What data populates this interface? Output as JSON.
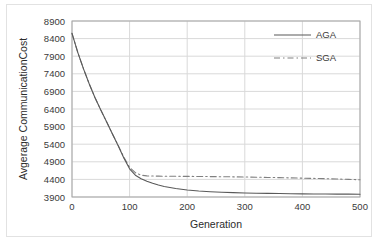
{
  "chart_data": {
    "type": "line",
    "title": "",
    "xlabel": "Generation",
    "ylabel": "Avgerage CommunicationCost",
    "xlim": [
      0,
      500
    ],
    "ylim": [
      3900,
      8900
    ],
    "xticks": [
      0,
      100,
      200,
      300,
      400,
      500
    ],
    "yticks": [
      3900,
      4400,
      4900,
      5400,
      5900,
      6400,
      6900,
      7400,
      7900,
      8400,
      8900
    ],
    "grid": "horizontal-and-vertical",
    "legend_position": "top-right",
    "x": [
      0,
      10,
      20,
      30,
      40,
      50,
      60,
      70,
      80,
      90,
      100,
      110,
      120,
      130,
      140,
      150,
      160,
      170,
      180,
      190,
      200,
      220,
      240,
      260,
      280,
      300,
      320,
      340,
      360,
      380,
      400,
      420,
      440,
      460,
      480,
      500
    ],
    "series": [
      {
        "name": "AGA",
        "style": "solid",
        "color": "#595959",
        "values": [
          8550,
          8010,
          7540,
          7110,
          6720,
          6370,
          6040,
          5700,
          5360,
          5010,
          4700,
          4520,
          4420,
          4350,
          4290,
          4240,
          4200,
          4170,
          4140,
          4120,
          4100,
          4070,
          4050,
          4035,
          4025,
          4015,
          4008,
          4002,
          3998,
          3994,
          3990,
          3987,
          3985,
          3983,
          3981,
          3980
        ]
      },
      {
        "name": "SGA",
        "style": "dash-dot",
        "color": "#808080",
        "values": [
          8550,
          8010,
          7540,
          7110,
          6720,
          6370,
          6040,
          5700,
          5370,
          5030,
          4740,
          4590,
          4520,
          4500,
          4495,
          4492,
          4490,
          4489,
          4488,
          4487,
          4486,
          4483,
          4480,
          4476,
          4472,
          4468,
          4462,
          4456,
          4450,
          4443,
          4436,
          4428,
          4420,
          4410,
          4400,
          4390
        ]
      }
    ]
  },
  "legend": {
    "items": [
      {
        "label": "AGA",
        "style": "solid"
      },
      {
        "label": "SGA",
        "style": "dash-dot"
      }
    ]
  },
  "colors": {
    "aga_line": "#595959",
    "sga_line": "#808080",
    "grid": "#d9d9d9",
    "axis": "#a6a6a6",
    "text": "#3a3a3a",
    "figure_border": "#e2e2e2",
    "background": "#ffffff"
  }
}
